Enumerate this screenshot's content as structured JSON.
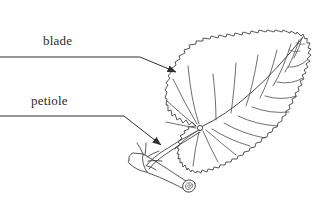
{
  "figure": {
    "background_color": "#ffffff",
    "ink_color": "#333333",
    "text_color": "#2b2b2b",
    "width": 321,
    "height": 213
  },
  "labels": [
    {
      "id": "blade",
      "text": "blade",
      "leader_line": {
        "x1": 0,
        "y1": 57,
        "x2": 140,
        "y2": 57
      },
      "arrow": {
        "x1": 140,
        "y1": 57,
        "x2": 176,
        "y2": 72
      }
    },
    {
      "id": "petiole",
      "text": "petiole",
      "leader_line": {
        "x1": 0,
        "y1": 116,
        "x2": 124,
        "y2": 116
      },
      "arrow": {
        "x1": 124,
        "y1": 116,
        "x2": 161,
        "y2": 145
      }
    }
  ],
  "parts": [
    {
      "id": "blade",
      "name": "blade",
      "description": "broad serrated leaf blade with pinnate venation"
    },
    {
      "id": "petiole",
      "name": "petiole",
      "description": "curved stalk joining blade to twig"
    },
    {
      "id": "twig",
      "name": "twig",
      "description": "cut woody stem with buds"
    }
  ]
}
